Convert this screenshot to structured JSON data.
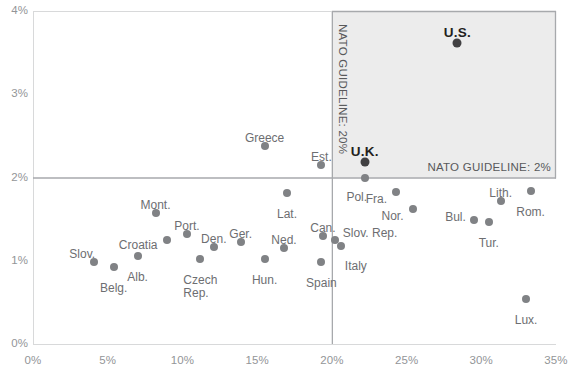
{
  "chart_data": {
    "type": "scatter",
    "title": "",
    "xlabel": "",
    "ylabel": "",
    "xlim": [
      0,
      35
    ],
    "ylim": [
      0,
      4
    ],
    "xtick_labels": [
      "0%",
      "5%",
      "10%",
      "15%",
      "20%",
      "25%",
      "30%",
      "35%"
    ],
    "xtick_values": [
      0,
      5,
      10,
      15,
      20,
      25,
      30,
      35
    ],
    "ytick_labels": [
      "0%",
      "1%",
      "2%",
      "3%",
      "4%"
    ],
    "ytick_values": [
      0,
      1,
      2,
      3,
      4
    ],
    "grid": false,
    "legend": "none",
    "annotations": [
      {
        "name": "nato-guideline-2pct",
        "text": "NATO GUIDELINE: 2%",
        "orientation": "horizontal",
        "value": 2
      },
      {
        "name": "nato-guideline-20pct",
        "text": "NATO GUIDELINE: 20%",
        "orientation": "vertical",
        "value": 20
      }
    ],
    "shaded_quadrant": {
      "x_from": 20,
      "x_to": 35,
      "y_from": 2,
      "y_to": 4,
      "color": "#ececec"
    },
    "points": [
      {
        "label": "Slov.",
        "x": 4.1,
        "y": 0.99,
        "lx": -12,
        "ly": -9,
        "align": "center",
        "emphasis": false
      },
      {
        "label": "Belg.",
        "x": 5.4,
        "y": 0.93,
        "lx": 0,
        "ly": 20,
        "align": "center",
        "emphasis": false
      },
      {
        "label": "Alb.",
        "x": 7.0,
        "y": 1.06,
        "lx": 0,
        "ly": 20,
        "align": "center",
        "emphasis": false
      },
      {
        "label": "Mont.",
        "x": 8.2,
        "y": 1.57,
        "lx": 0,
        "ly": -9,
        "align": "center",
        "emphasis": false
      },
      {
        "label": "Croatia",
        "x": 9.0,
        "y": 1.25,
        "lx": -10,
        "ly": 4,
        "align": "right",
        "emphasis": false
      },
      {
        "label": "Port.",
        "x": 10.3,
        "y": 1.32,
        "lx": 0,
        "ly": -9,
        "align": "center",
        "emphasis": false
      },
      {
        "label": "Czech\nRep.",
        "x": 11.2,
        "y": 1.02,
        "lx": 0,
        "ly": 20,
        "align": "center",
        "emphasis": false
      },
      {
        "label": "Den.",
        "x": 12.1,
        "y": 1.17,
        "lx": 0,
        "ly": -9,
        "align": "center",
        "emphasis": false
      },
      {
        "label": "Ger.",
        "x": 13.9,
        "y": 1.22,
        "lx": 0,
        "ly": -9,
        "align": "center",
        "emphasis": false
      },
      {
        "label": "Greece",
        "x": 15.5,
        "y": 2.38,
        "lx": 0,
        "ly": -9,
        "align": "center",
        "emphasis": false
      },
      {
        "label": "Hun.",
        "x": 15.5,
        "y": 1.02,
        "lx": 0,
        "ly": 20,
        "align": "center",
        "emphasis": false
      },
      {
        "label": "Lat.",
        "x": 17.0,
        "y": 1.81,
        "lx": 0,
        "ly": 20,
        "align": "center",
        "emphasis": false
      },
      {
        "label": "Ned.",
        "x": 16.8,
        "y": 1.15,
        "lx": 0,
        "ly": -9,
        "align": "center",
        "emphasis": false
      },
      {
        "label": "Est.",
        "x": 19.3,
        "y": 2.15,
        "lx": 0,
        "ly": -9,
        "align": "center",
        "emphasis": false
      },
      {
        "label": "Can.",
        "x": 19.4,
        "y": 1.3,
        "lx": 0,
        "ly": -9,
        "align": "center",
        "emphasis": false
      },
      {
        "label": "Spain",
        "x": 19.3,
        "y": 0.98,
        "lx": 0,
        "ly": 20,
        "align": "center",
        "emphasis": false
      },
      {
        "label": "U.K.",
        "x": 22.2,
        "y": 2.19,
        "lx": 0,
        "ly": -11,
        "align": "center",
        "emphasis": true
      },
      {
        "label": "Pol.",
        "x": 22.2,
        "y": 2.0,
        "lx": -8,
        "ly": 18,
        "align": "center",
        "emphasis": false
      },
      {
        "label": "Slov. Rep.",
        "x": 20.2,
        "y": 1.25,
        "lx": 8,
        "ly": -8,
        "align": "left",
        "emphasis": false
      },
      {
        "label": "Italy",
        "x": 20.6,
        "y": 1.18,
        "lx": 4,
        "ly": 19,
        "align": "left",
        "emphasis": false
      },
      {
        "label": "Fra.",
        "x": 24.3,
        "y": 1.82,
        "lx": -9,
        "ly": 6,
        "align": "right",
        "emphasis": false
      },
      {
        "label": "Nor.",
        "x": 25.4,
        "y": 1.62,
        "lx": -9,
        "ly": 6,
        "align": "right",
        "emphasis": false
      },
      {
        "label": "U.S.",
        "x": 28.4,
        "y": 3.62,
        "lx": 0,
        "ly": -11,
        "align": "center",
        "emphasis": true
      },
      {
        "label": "Bul.",
        "x": 29.5,
        "y": 1.49,
        "lx": -8,
        "ly": -4,
        "align": "right",
        "emphasis": false
      },
      {
        "label": "Lith.",
        "x": 31.3,
        "y": 1.72,
        "lx": 0,
        "ly": -9,
        "align": "center",
        "emphasis": false
      },
      {
        "label": "Tur.",
        "x": 30.5,
        "y": 1.46,
        "lx": 0,
        "ly": 20,
        "align": "center",
        "emphasis": false
      },
      {
        "label": "Rom.",
        "x": 33.3,
        "y": 1.84,
        "lx": 0,
        "ly": 20,
        "align": "center",
        "emphasis": false
      },
      {
        "label": "Lux.",
        "x": 33.0,
        "y": 0.54,
        "lx": 0,
        "ly": 20,
        "align": "center",
        "emphasis": false
      }
    ]
  }
}
